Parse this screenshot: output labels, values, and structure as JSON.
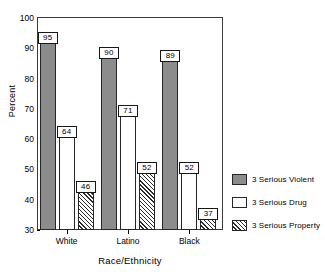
{
  "chart_data": {
    "type": "bar",
    "title": "",
    "subtitle": "",
    "xlabel": "Race/Ethnicity",
    "ylabel": "Percent",
    "categories": [
      "White",
      "Latino",
      "Black"
    ],
    "series": [
      {
        "name": "3 Serious Violent",
        "values": [
          95,
          90,
          89
        ],
        "color": "#8c8c8c",
        "fill": "solid-gray"
      },
      {
        "name": "3 Serious Drug",
        "values": [
          64,
          71,
          52
        ],
        "color": "#ffffff",
        "fill": "white"
      },
      {
        "name": "3 Serious Property",
        "values": [
          46,
          52,
          37
        ],
        "color": "#ffffff",
        "fill": "diagonal-hatch"
      }
    ],
    "ylim": [
      30,
      100
    ],
    "ytick_labels": [
      "30",
      "40",
      "50",
      "60",
      "70",
      "80",
      "90",
      "100"
    ],
    "ytick_values": [
      30,
      40,
      50,
      60,
      70,
      80,
      90,
      100
    ],
    "grid": false,
    "legend_position": "right",
    "data_labels": true,
    "data_label_style": "boxed"
  },
  "legend": {
    "items": [
      {
        "label": "3 Serious Violent"
      },
      {
        "label": "3 Serious Drug"
      },
      {
        "label": "3 Serious Property"
      }
    ]
  }
}
